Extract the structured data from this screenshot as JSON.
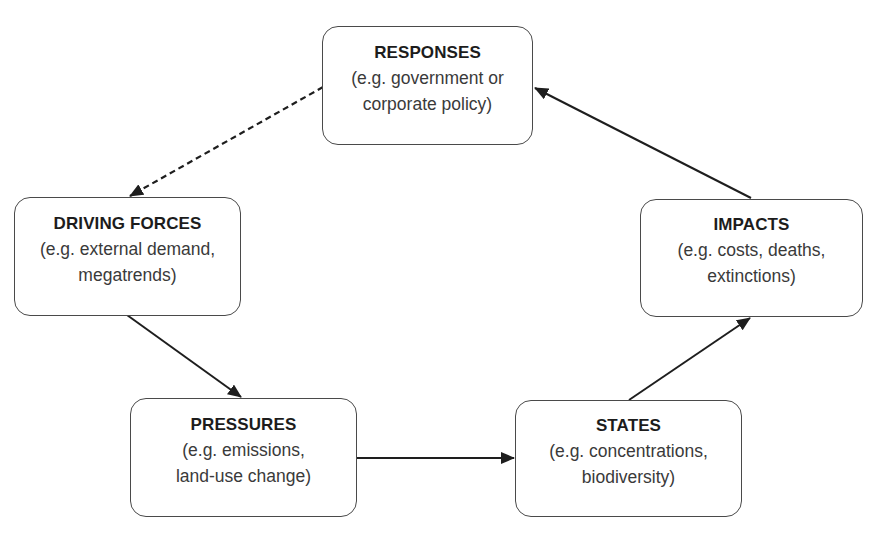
{
  "diagram": {
    "type": "cycle-flow",
    "colors": {
      "border": "#4a4a4a",
      "arrow": "#1e1e1e",
      "title_text": "#1c1c1c",
      "desc_text": "#3a3a3a",
      "background": "#ffffff"
    },
    "nodes": [
      {
        "id": "responses",
        "title": "RESPONSES",
        "description": "(e.g. government or\ncorporate policy)"
      },
      {
        "id": "driving_forces",
        "title": "DRIVING FORCES",
        "description": "(e.g. external demand,\nmegatrends)"
      },
      {
        "id": "pressures",
        "title": "PRESSURES",
        "description": "(e.g. emissions,\nland-use change)"
      },
      {
        "id": "states",
        "title": "STATES",
        "description": "(e.g. concentrations,\nbiodiversity)"
      },
      {
        "id": "impacts",
        "title": "IMPACTS",
        "description": "(e.g. costs, deaths,\nextinctions)"
      }
    ],
    "edges": [
      {
        "from": "responses",
        "to": "driving_forces",
        "style": "dashed"
      },
      {
        "from": "driving_forces",
        "to": "pressures",
        "style": "solid"
      },
      {
        "from": "pressures",
        "to": "states",
        "style": "solid"
      },
      {
        "from": "states",
        "to": "impacts",
        "style": "solid"
      },
      {
        "from": "impacts",
        "to": "responses",
        "style": "solid"
      }
    ]
  }
}
